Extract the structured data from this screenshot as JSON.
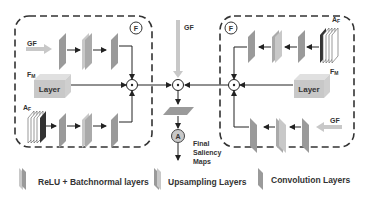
{
  "diagram": {
    "left_module": {
      "badge": "F",
      "gf_label": "GF",
      "fm_label": "F",
      "fm_sub": "M",
      "af_label": "A",
      "af_sub": "F",
      "layer_label": "Layer"
    },
    "right_module": {
      "badge": "F",
      "gf_label": "GF",
      "fm_label": "F",
      "fm_sub": "M",
      "af_label": "A",
      "af_sub": "F",
      "layer_label": "Layer"
    },
    "center": {
      "gf_label": "GF",
      "output_badge": "A",
      "output_line1": "Final",
      "output_line2": "Saliency",
      "output_line3": "Maps"
    },
    "legend": {
      "items": [
        {
          "label": "ReLU + Batchnormal layers"
        },
        {
          "label": "Upsampling Layers"
        },
        {
          "label": "Convolution Layers"
        }
      ]
    },
    "colors": {
      "layer_fill": "#9a9a9a",
      "layer_light": "#c8c8c8",
      "gf_arrow": "#c8c8c8",
      "dashed_border": "#333333",
      "stack_dark": "#333333"
    }
  }
}
